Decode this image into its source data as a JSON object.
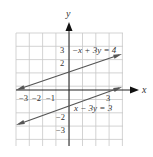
{
  "figure": {
    "type": "coordinate-graph",
    "axes": {
      "x_label": "x",
      "y_label": "y",
      "x_ticks": [
        {
          "value": -3,
          "label": "−3"
        },
        {
          "value": -2,
          "label": "−2"
        },
        {
          "value": -1,
          "label": "−1"
        },
        {
          "value": 3,
          "label": "3"
        }
      ],
      "y_ticks": [
        {
          "value": 3,
          "label": "3"
        },
        {
          "value": 2,
          "label": "2"
        },
        {
          "value": -2,
          "label": "−2"
        },
        {
          "value": -3,
          "label": "−3"
        }
      ],
      "x_range": [
        -4,
        4
      ],
      "y_range": [
        -4,
        4
      ],
      "grid": true
    },
    "lines": [
      {
        "equation": "−x + 3y = 4",
        "slope": 0.3333,
        "intercept": 1.3333,
        "label_pos": "upper"
      },
      {
        "equation": "x − 3y = 3",
        "slope": 0.3333,
        "intercept": -1,
        "label_pos": "lower"
      }
    ],
    "colors": {
      "grid": "#c8c8c8",
      "axis": "#222222",
      "line": "#555555",
      "text": "#333333"
    }
  }
}
